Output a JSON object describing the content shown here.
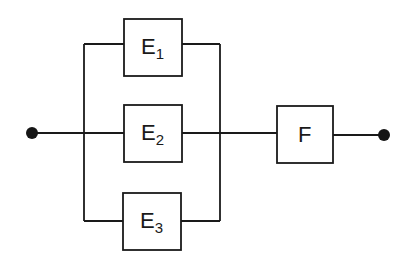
{
  "diagram": {
    "type": "reliability-block-diagram",
    "colors": {
      "line": "#1a1a1a",
      "node": "#151515",
      "background": "#ffffff"
    },
    "terminals": [
      {
        "id": "input",
        "label": ""
      },
      {
        "id": "output",
        "label": ""
      }
    ],
    "blocks": [
      {
        "id": "E1",
        "main": "E",
        "sub": "1",
        "group": "parallel"
      },
      {
        "id": "E2",
        "main": "E",
        "sub": "2",
        "group": "parallel"
      },
      {
        "id": "E3",
        "main": "E",
        "sub": "3",
        "group": "parallel"
      },
      {
        "id": "F",
        "main": "F",
        "sub": "",
        "group": "series"
      }
    ],
    "connections": [
      [
        "input",
        "E1"
      ],
      [
        "input",
        "E2"
      ],
      [
        "input",
        "E3"
      ],
      [
        "E1",
        "F"
      ],
      [
        "E2",
        "F"
      ],
      [
        "E3",
        "F"
      ],
      [
        "F",
        "output"
      ]
    ]
  }
}
